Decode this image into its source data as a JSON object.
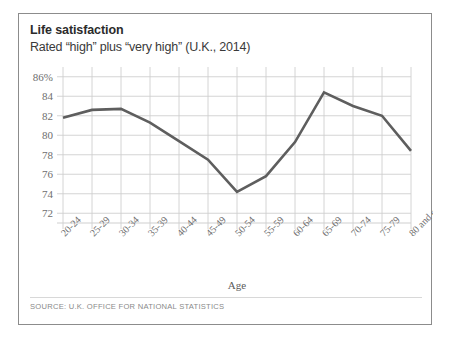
{
  "card": {
    "title": "Life satisfaction",
    "subtitle": "Rated “high” plus “very high” (U.K., 2014)",
    "source": "SOURCE: U.K. OFFICE FOR NATIONAL STATISTICS",
    "border_color": "#8c8c8c",
    "background_color": "#ffffff"
  },
  "chart_data": {
    "type": "line",
    "title": "Life satisfaction",
    "subtitle": "Rated “high” plus “very high” (U.K., 2014)",
    "xlabel": "Age",
    "ylabel": "",
    "categories": [
      "20-24",
      "25-29",
      "30-34",
      "35-39",
      "40-44",
      "45-49",
      "50-54",
      "55-59",
      "60-64",
      "65-69",
      "70-74",
      "75-79",
      "80 and over"
    ],
    "values": [
      81.8,
      82.6,
      82.7,
      81.3,
      79.4,
      77.5,
      74.2,
      75.8,
      79.3,
      84.4,
      83.0,
      82.0,
      78.4
    ],
    "ylim": [
      71,
      87
    ],
    "yticks": [
      72,
      74,
      76,
      78,
      80,
      82,
      84,
      86
    ],
    "ytick_labels": [
      "72",
      "74",
      "76",
      "78",
      "80",
      "82",
      "84",
      "86%"
    ],
    "grid": true,
    "grid_color": "#cfcfcf",
    "line_color": "#5e5e5e",
    "line_width": 2.6,
    "legend": false,
    "legend_position": "none",
    "xtick_rotation": -45
  }
}
